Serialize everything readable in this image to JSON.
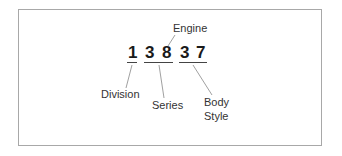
{
  "diagram": {
    "code": "13837",
    "digits": [
      "1",
      "3",
      "8",
      "3",
      "7"
    ],
    "labels": {
      "engine": "Engine",
      "division": "Division",
      "series": "Series",
      "body_line1": "Body",
      "body_line2": "Style"
    },
    "groups": [
      {
        "name": "Division",
        "digits": "1"
      },
      {
        "name": "Series",
        "digits": "38"
      },
      {
        "name": "Engine",
        "digits": "8"
      },
      {
        "name": "Body Style",
        "digits": "37"
      }
    ],
    "colors": {
      "border": "#a8a8a8",
      "digits": "#1a1a1a",
      "labels": "#333333",
      "leaders": "#888888"
    }
  }
}
